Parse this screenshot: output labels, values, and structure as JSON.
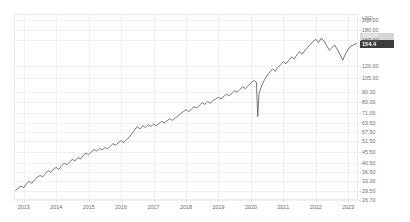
{
  "chart_data": {
    "type": "line",
    "title": "",
    "subtitle": "",
    "xlabel": "",
    "ylabel": "",
    "unit_label": "USD",
    "scale": "log",
    "grid": true,
    "legend": "none",
    "line_color": "#555555",
    "marker_current_bg": "#3c3c3c",
    "marker_prev_bg": "#d6d6d6",
    "current_price_label": "154.4",
    "previous_close_label": "154.25",
    "y_ticks": [
      "200.00",
      "180.00",
      "160.00",
      "120.00",
      "105.00",
      "90.00",
      "80.00",
      "71.00",
      "63.50",
      "57.50",
      "51.50",
      "45.50",
      "40.50",
      "36.50",
      "33.00",
      "29.50",
      "26.70"
    ],
    "y_tick_values": [
      200.0,
      180.0,
      160.0,
      120.0,
      105.0,
      90.0,
      80.0,
      71.0,
      63.5,
      57.5,
      51.5,
      45.5,
      40.5,
      36.5,
      33.0,
      29.5,
      26.7
    ],
    "x_ticks": [
      "2013",
      "2014",
      "2015",
      "2016",
      "2017",
      "2018",
      "2019",
      "2020",
      "2021",
      "2022",
      "2023"
    ],
    "x_range": [
      "2012-09",
      "2023-04"
    ],
    "ylim": [
      26.7,
      215.0
    ],
    "series": [
      {
        "name": "price",
        "x": [
          2012.75,
          2012.83,
          2012.92,
          2013.0,
          2013.08,
          2013.17,
          2013.25,
          2013.33,
          2013.42,
          2013.5,
          2013.58,
          2013.67,
          2013.75,
          2013.83,
          2013.92,
          2014.0,
          2014.08,
          2014.17,
          2014.25,
          2014.33,
          2014.42,
          2014.5,
          2014.58,
          2014.67,
          2014.75,
          2014.83,
          2014.92,
          2015.0,
          2015.08,
          2015.17,
          2015.25,
          2015.33,
          2015.42,
          2015.5,
          2015.58,
          2015.67,
          2015.75,
          2015.83,
          2015.92,
          2016.0,
          2016.08,
          2016.17,
          2016.25,
          2016.33,
          2016.42,
          2016.5,
          2016.58,
          2016.67,
          2016.75,
          2016.83,
          2016.92,
          2017.0,
          2017.08,
          2017.17,
          2017.25,
          2017.33,
          2017.42,
          2017.5,
          2017.58,
          2017.67,
          2017.75,
          2017.83,
          2017.92,
          2018.0,
          2018.08,
          2018.17,
          2018.25,
          2018.33,
          2018.42,
          2018.5,
          2018.58,
          2018.67,
          2018.75,
          2018.83,
          2018.92,
          2019.0,
          2019.08,
          2019.17,
          2019.25,
          2019.33,
          2019.42,
          2019.5,
          2019.58,
          2019.67,
          2019.75,
          2019.83,
          2019.92,
          2020.0,
          2020.08,
          2020.17,
          2020.21,
          2020.25,
          2020.33,
          2020.42,
          2020.5,
          2020.58,
          2020.67,
          2020.75,
          2020.83,
          2020.92,
          2021.0,
          2021.08,
          2021.17,
          2021.25,
          2021.33,
          2021.42,
          2021.5,
          2021.58,
          2021.67,
          2021.75,
          2021.83,
          2021.92,
          2022.0,
          2022.08,
          2022.17,
          2022.25,
          2022.33,
          2022.42,
          2022.5,
          2022.58,
          2022.67,
          2022.75,
          2022.83,
          2022.92,
          2023.0,
          2023.08,
          2023.17,
          2023.25
        ],
        "values": [
          29.8,
          30.5,
          31.2,
          30.6,
          32.0,
          33.0,
          32.2,
          33.5,
          34.4,
          35.2,
          34.6,
          36.0,
          37.2,
          36.4,
          37.8,
          38.5,
          37.6,
          39.2,
          40.4,
          39.6,
          41.0,
          42.2,
          41.4,
          43.0,
          42.2,
          44.0,
          45.2,
          44.4,
          45.8,
          47.0,
          46.2,
          47.6,
          46.8,
          48.2,
          47.4,
          48.8,
          50.2,
          49.4,
          50.8,
          52.0,
          50.8,
          52.6,
          54.0,
          56.2,
          58.5,
          60.8,
          59.2,
          61.5,
          60.2,
          62.0,
          61.0,
          62.5,
          61.4,
          63.0,
          64.5,
          63.4,
          65.0,
          66.5,
          65.2,
          67.0,
          68.5,
          70.2,
          72.0,
          73.5,
          72.0,
          74.0,
          76.0,
          75.0,
          77.5,
          79.5,
          78.0,
          80.5,
          79.0,
          81.5,
          83.0,
          84.5,
          83.0,
          85.5,
          87.5,
          86.0,
          88.5,
          91.0,
          89.5,
          92.5,
          95.0,
          93.0,
          96.5,
          99.0,
          102.0,
          100.0,
          68.0,
          88.0,
          96.0,
          103.0,
          108.0,
          112.0,
          116.0,
          113.0,
          118.0,
          122.0,
          126.0,
          123.0,
          128.0,
          133.0,
          130.0,
          136.0,
          141.0,
          137.0,
          143.0,
          148.0,
          153.0,
          158.0,
          162.0,
          156.0,
          164.0,
          159.0,
          151.0,
          143.0,
          148.0,
          152.0,
          144.0,
          136.0,
          128.0,
          138.0,
          145.0,
          150.0,
          152.0,
          154.4
        ]
      }
    ]
  }
}
